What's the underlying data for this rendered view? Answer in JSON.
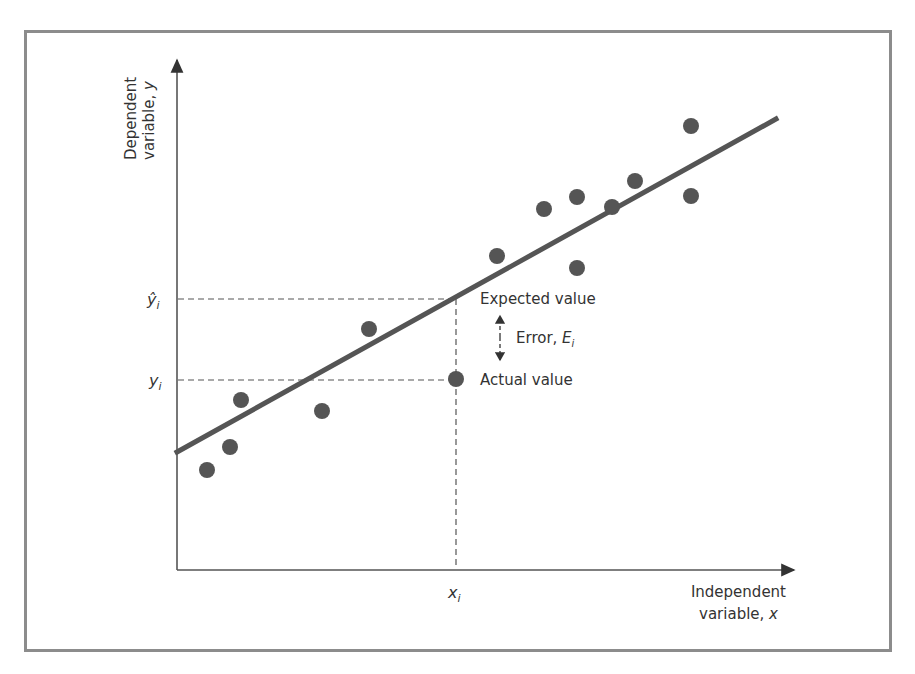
{
  "chart_data": {
    "type": "scatter",
    "title": "",
    "xlabel": "Independent variable, x",
    "ylabel": "Dependent variable, y",
    "grid": false,
    "points_px": [
      [
        207,
        470
      ],
      [
        230,
        447
      ],
      [
        241,
        400
      ],
      [
        322,
        411
      ],
      [
        369,
        329
      ],
      [
        456,
        379
      ],
      [
        497,
        256
      ],
      [
        544,
        209
      ],
      [
        577,
        197
      ],
      [
        577,
        268
      ],
      [
        612,
        207
      ],
      [
        635,
        181
      ],
      [
        691,
        126
      ],
      [
        691,
        196
      ]
    ],
    "regression_line_px": [
      [
        177,
        452
      ],
      [
        776,
        119
      ]
    ],
    "annotations": {
      "y_hat_label": "ŷ",
      "y_label": "y",
      "subscript": "i",
      "x_label": "x",
      "expected": "Expected value",
      "error": "Error, ",
      "error_symbol": "E",
      "actual": "Actual value"
    }
  },
  "axes": {
    "y_title_line1": "Dependent",
    "y_title_line2": "variable, ",
    "y_title_var": "y",
    "x_title_line1": "Independent",
    "x_title_line2": "variable, ",
    "x_title_var": "x"
  },
  "colors": {
    "dot": "#555555",
    "line": "#555555",
    "axis": "#444444",
    "border": "#8c8c8c"
  }
}
